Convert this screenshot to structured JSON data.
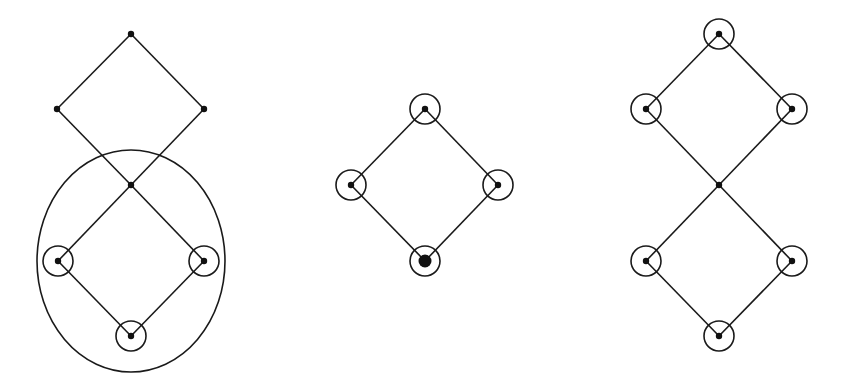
{
  "colors": {
    "background": "#ffffff",
    "stroke": "#1a1a1a",
    "node": "#111111"
  },
  "diagrams": [
    {
      "name": "left-lattice",
      "nodes": [
        {
          "id": "top",
          "x": 131,
          "y": 34,
          "ring": false,
          "big": false
        },
        {
          "id": "left",
          "x": 57,
          "y": 109,
          "ring": false,
          "big": false
        },
        {
          "id": "right",
          "x": 204,
          "y": 109,
          "ring": false,
          "big": false
        },
        {
          "id": "center",
          "x": 131,
          "y": 185,
          "ring": false,
          "big": false
        },
        {
          "id": "lower-left",
          "x": 58,
          "y": 261,
          "ring": true,
          "big": false
        },
        {
          "id": "lower-right",
          "x": 204,
          "y": 261,
          "ring": true,
          "big": false
        },
        {
          "id": "bottom",
          "x": 131,
          "y": 336,
          "ring": true,
          "big": false
        }
      ],
      "edges": [
        [
          "top",
          "left"
        ],
        [
          "top",
          "right"
        ],
        [
          "left",
          "center"
        ],
        [
          "right",
          "center"
        ],
        [
          "center",
          "lower-left"
        ],
        [
          "center",
          "lower-right"
        ],
        [
          "lower-left",
          "bottom"
        ],
        [
          "lower-right",
          "bottom"
        ]
      ],
      "enclosure": {
        "cx": 131,
        "cy": 261,
        "rx": 94,
        "ry": 111
      }
    },
    {
      "name": "middle-lattice",
      "nodes": [
        {
          "id": "top",
          "x": 425,
          "y": 109,
          "ring": true,
          "big": false
        },
        {
          "id": "left",
          "x": 351,
          "y": 185,
          "ring": true,
          "big": false
        },
        {
          "id": "right",
          "x": 498,
          "y": 185,
          "ring": true,
          "big": false
        },
        {
          "id": "bottom",
          "x": 425,
          "y": 261,
          "ring": true,
          "big": true
        }
      ],
      "edges": [
        [
          "top",
          "left"
        ],
        [
          "top",
          "right"
        ],
        [
          "left",
          "bottom"
        ],
        [
          "right",
          "bottom"
        ]
      ],
      "enclosure": null
    },
    {
      "name": "right-lattice",
      "nodes": [
        {
          "id": "top",
          "x": 719,
          "y": 34,
          "ring": true,
          "big": false
        },
        {
          "id": "left",
          "x": 646,
          "y": 109,
          "ring": true,
          "big": false
        },
        {
          "id": "right",
          "x": 792,
          "y": 109,
          "ring": true,
          "big": false
        },
        {
          "id": "center",
          "x": 719,
          "y": 185,
          "ring": false,
          "big": false
        },
        {
          "id": "lower-left",
          "x": 646,
          "y": 261,
          "ring": true,
          "big": false
        },
        {
          "id": "lower-right",
          "x": 792,
          "y": 261,
          "ring": true,
          "big": false
        },
        {
          "id": "bottom",
          "x": 719,
          "y": 336,
          "ring": true,
          "big": false
        }
      ],
      "edges": [
        [
          "top",
          "left"
        ],
        [
          "top",
          "right"
        ],
        [
          "left",
          "center"
        ],
        [
          "right",
          "center"
        ],
        [
          "center",
          "lower-left"
        ],
        [
          "center",
          "lower-right"
        ],
        [
          "lower-left",
          "bottom"
        ],
        [
          "lower-right",
          "bottom"
        ]
      ],
      "enclosure": null
    }
  ],
  "style": {
    "dot_radius": 3.2,
    "big_dot_radius": 6.5,
    "ring_radius": 15
  }
}
